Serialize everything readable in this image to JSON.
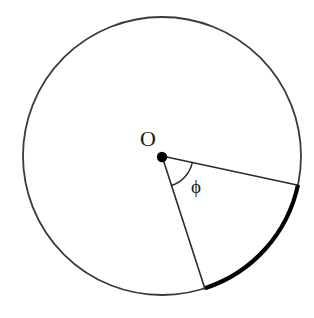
{
  "figure": {
    "type": "geometry-diagram",
    "canvas": {
      "width": 314,
      "height": 318,
      "background": "#ffffff"
    },
    "colors": {
      "circle_stroke": "#3a3a3a",
      "radius_stroke": "#2b2b2b",
      "highlight_arc": "#000000",
      "center_dot": "#000000",
      "label": "#1a1a1a"
    },
    "circle": {
      "name": "main-circle",
      "center_x": 162,
      "center_y": 156,
      "radius": 139,
      "stroke_width": 1.8
    },
    "center_point": {
      "name": "center-point-O",
      "x": 162,
      "y": 157,
      "dot_radius": 5.2
    },
    "labels": {
      "center": "O",
      "angle": "ϕ"
    },
    "label_positions": {
      "center_x": 148,
      "center_y": 146,
      "center_font_size": 22,
      "angle_x": 196,
      "angle_y": 193,
      "angle_font_size": 19
    },
    "radii": [
      {
        "name": "radius-upper",
        "angle_deg": 12,
        "end_x": 297,
        "end_y": 185,
        "stroke_width": 1.6
      },
      {
        "name": "radius-lower",
        "angle_deg": 72,
        "end_x": 205,
        "end_y": 289,
        "stroke_width": 1.6
      }
    ],
    "highlight_arc": {
      "name": "highlighted-arc",
      "start_angle_deg": 12,
      "end_angle_deg": 72,
      "sweep_deg": 60,
      "stroke_width": 4.2,
      "start_x": 298,
      "start_y": 185,
      "end_x": 205,
      "end_y": 288
    },
    "angle_marker": {
      "name": "angle-arc-phi",
      "radius": 31,
      "start_angle_deg": 12,
      "end_angle_deg": 72,
      "stroke_width": 1.5,
      "start_x": 192,
      "start_y": 163,
      "end_x": 172,
      "end_y": 186
    }
  }
}
